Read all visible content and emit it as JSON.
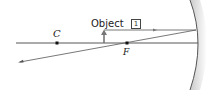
{
  "diagram": {
    "type": "concave-mirror-ray-diagram",
    "labels": {
      "object": "Object",
      "center_of_curvature": "C",
      "focal_point": "F",
      "step": "1"
    },
    "colors": {
      "axis": "#444444",
      "ray": "#555555",
      "object_arrow": "#777777",
      "mirror": "#555555",
      "mirror_shade": "#cccccc",
      "point": "#111111"
    }
  }
}
